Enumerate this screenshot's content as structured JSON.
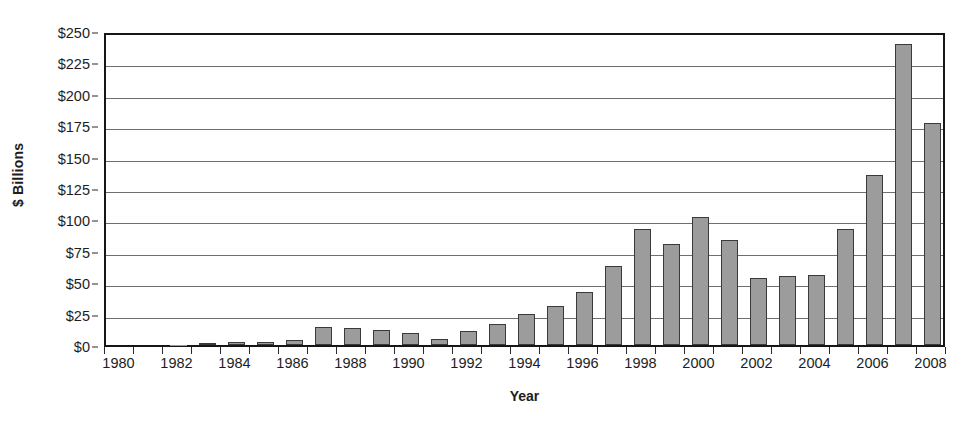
{
  "chart_data": {
    "type": "bar",
    "title": "",
    "xlabel": "Year",
    "ylabel": "$ Billions",
    "ylim": [
      0,
      250
    ],
    "ytick_step": 25,
    "ytick_labels": [
      "$0",
      "$25",
      "$50",
      "$75",
      "$100",
      "$125",
      "$150",
      "$175",
      "$200",
      "$225",
      "$250"
    ],
    "ytick_values": [
      0,
      25,
      50,
      75,
      100,
      125,
      150,
      175,
      200,
      225,
      250
    ],
    "xtick_labels": [
      "1980",
      "1982",
      "1984",
      "1986",
      "1988",
      "1990",
      "1992",
      "1994",
      "1996",
      "1998",
      "2000",
      "2002",
      "2004",
      "2006",
      "2008"
    ],
    "grid": "horizontal",
    "legend": "none",
    "bar_color": "#9c9c9c",
    "bar_border_color": "#3a3a3a",
    "axis_color": "#161616",
    "gridline_color": "#6e6e6e",
    "categories": [
      "1980",
      "1981",
      "1982",
      "1983",
      "1984",
      "1985",
      "1986",
      "1987",
      "1988",
      "1989",
      "1990",
      "1991",
      "1992",
      "1993",
      "1994",
      "1995",
      "1996",
      "1997",
      "1998",
      "1999",
      "2000",
      "2001",
      "2002",
      "2003",
      "2004",
      "2005",
      "2006",
      "2007",
      "2008"
    ],
    "values": [
      0,
      0,
      0.3,
      1.2,
      2.6,
      2.6,
      4.2,
      14.5,
      13.5,
      12,
      9.5,
      5,
      11,
      17,
      25,
      31,
      42,
      63,
      92,
      80.5,
      102,
      84,
      53,
      55,
      56,
      92,
      135,
      240,
      177
    ]
  }
}
